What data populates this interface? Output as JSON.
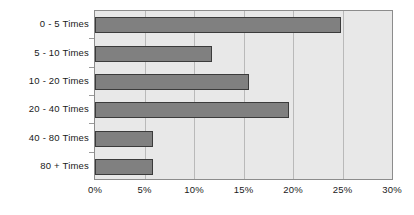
{
  "chart_data": {
    "type": "bar",
    "orientation": "horizontal",
    "title": "",
    "subtitle": "",
    "xlabel": "",
    "ylabel": "",
    "categories": [
      "0 - 5 Times",
      "5 - 10 Times",
      "10 - 20 Times",
      "20 - 40 Times",
      "40 - 80 Times",
      "80 + Times"
    ],
    "values": [
      24.8,
      11.8,
      15.6,
      19.6,
      5.9,
      5.9
    ],
    "value_unit": "%",
    "xlim": [
      0,
      30
    ],
    "xticks": [
      0,
      5,
      10,
      15,
      20,
      25,
      30
    ],
    "xtick_labels": [
      "0%",
      "5%",
      "10%",
      "15%",
      "20%",
      "25%",
      "30%"
    ],
    "grid": "vertical",
    "legend": "none",
    "series": [
      {
        "name": "",
        "values": [
          24.8,
          11.8,
          15.6,
          19.6,
          5.9,
          5.9
        ]
      }
    ],
    "colors": {
      "bar_fill": "#808080",
      "bar_border": "#3b3b3b",
      "plot_background": "#e8e8e8",
      "plot_border": "#8c8c8c",
      "gridline": "#b9b9b9",
      "text": "#1a1a1a",
      "page_background": "#ffffff"
    }
  }
}
